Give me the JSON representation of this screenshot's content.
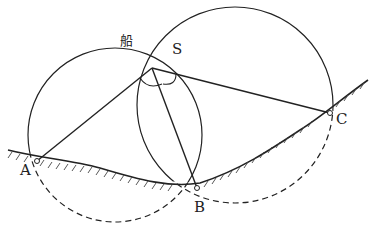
{
  "diagram": {
    "type": "three-point resection (two circles method)",
    "labels": {
      "ship": "船",
      "S": "S",
      "A": "A",
      "B": "B",
      "C": "C"
    },
    "points": {
      "S": [
        152,
        68
      ],
      "A": [
        37,
        161
      ],
      "B": [
        197,
        188
      ],
      "C": [
        330,
        113
      ]
    },
    "circles": [
      {
        "name": "circle-ASB",
        "center": [
          115,
          135
        ],
        "r": 87
      },
      {
        "name": "circle-SBC",
        "center": [
          235,
          105
        ],
        "r": 98
      }
    ],
    "colors": {
      "line": "#222222",
      "background": "#ffffff"
    }
  }
}
